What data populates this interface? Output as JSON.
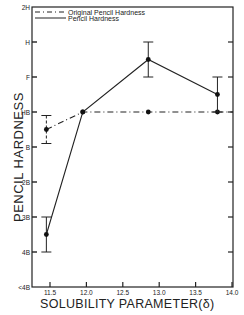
{
  "chart_data": {
    "type": "line",
    "title": "",
    "xlabel": "SOLUBILITY PARAMETER(δ)",
    "ylabel": "PENCIL HARDNESS",
    "xlim": [
      11.35,
      14.0
    ],
    "x_ticks": [
      "11.5",
      "12.0",
      "12.5",
      "13.0",
      "13.5",
      "14.0"
    ],
    "y_ticks": [
      "2H",
      "H",
      "F",
      "HB",
      "B",
      "2B",
      "3B",
      "4B",
      "<4B"
    ],
    "y_scale_note": "ordinal pencil hardness, 0 = <4B ... 8 = 2H",
    "grid": false,
    "legend_position": "top-left inside",
    "legend": [
      {
        "label": "Original Pencil Hardness",
        "style": "dash-dot"
      },
      {
        "label": "Pencil Hardness",
        "style": "solid"
      }
    ],
    "series": [
      {
        "name": "Original Pencil Hardness",
        "style": "dash-dot",
        "x": [
          11.45,
          11.95,
          12.85,
          13.8
        ],
        "values": [
          "B/HB (4.5)",
          "HB (5)",
          "HB (5)",
          "HB (5)"
        ],
        "numeric": [
          4.5,
          5,
          5,
          5
        ],
        "error_bars": [
          [
            4.1,
            4.9
          ],
          null,
          null,
          null
        ]
      },
      {
        "name": "Pencil Hardness",
        "style": "solid",
        "x": [
          11.45,
          11.95,
          12.85,
          13.8
        ],
        "values": [
          "4B/3B (1.5)",
          "HB (5)",
          "F/H (6.5)",
          "HB/F (5.5)"
        ],
        "numeric": [
          1.5,
          5,
          6.5,
          5.5
        ],
        "error_bars": [
          [
            1,
            2
          ],
          null,
          [
            6,
            7
          ],
          [
            5,
            6
          ]
        ]
      }
    ]
  }
}
